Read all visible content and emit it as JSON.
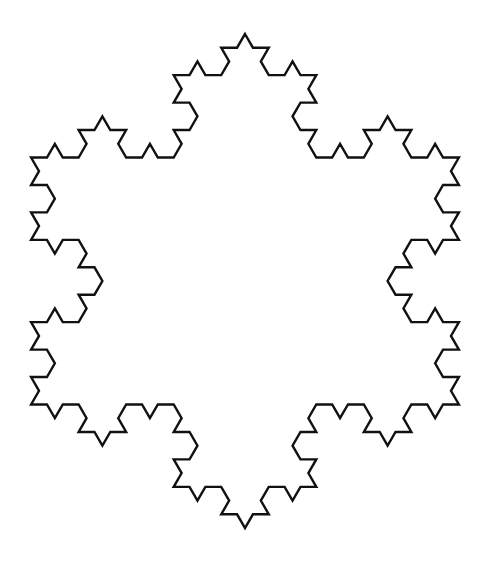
{
  "figure": {
    "type": "koch-snowflake",
    "iterations": 3,
    "center": [
      245,
      281
    ],
    "tip_radius": 247,
    "orientation": "tips-at-top-and-bottom",
    "stroke_color": "#111111",
    "background_color": "#ffffff",
    "stroke_width": 2.4
  }
}
